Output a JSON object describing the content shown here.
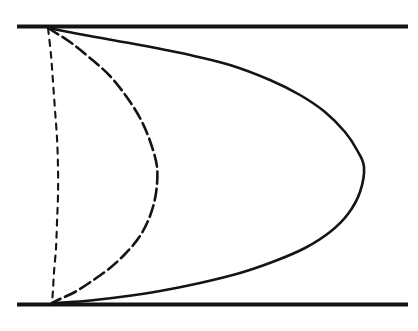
{
  "figure": {
    "background_color": "#ffffff",
    "width": 418,
    "height": 331
  },
  "chart_data": {
    "type": "line",
    "xlabel": "",
    "ylabel": "",
    "xlim": [
      0,
      418
    ],
    "ylim": [
      331,
      0
    ],
    "grid": false,
    "legend": false,
    "annotations": [],
    "walls": {
      "color": "#141414",
      "stroke_width": 4.2,
      "x_start": 17,
      "x_end": 408,
      "top_y": 26.5,
      "bottom_y": 304.5
    },
    "series": [
      {
        "name": "fully-developed-profile",
        "style": "solid",
        "color": "#141414",
        "stroke_width": 2.6,
        "dash_pattern": "none",
        "apex_x": 364,
        "apex_y": 167,
        "top_anchor_x": 48,
        "top_anchor_y": 28,
        "bottom_anchor_x": 52,
        "bottom_anchor_y": 303,
        "points": [
          [
            48,
            28
          ],
          [
            90,
            36
          ],
          [
            140,
            45
          ],
          [
            190,
            55
          ],
          [
            230,
            65
          ],
          [
            270,
            80
          ],
          [
            300,
            95
          ],
          [
            325,
            112
          ],
          [
            345,
            132
          ],
          [
            357,
            150
          ],
          [
            364,
            167
          ],
          [
            360,
            192
          ],
          [
            348,
            214
          ],
          [
            330,
            232
          ],
          [
            305,
            248
          ],
          [
            275,
            261
          ],
          [
            240,
            273
          ],
          [
            200,
            283
          ],
          [
            160,
            291
          ],
          [
            120,
            297
          ],
          [
            85,
            301
          ],
          [
            52,
            303
          ]
        ]
      },
      {
        "name": "intermediate-profile",
        "style": "dashed-long",
        "color": "#141414",
        "stroke_width": 2.6,
        "dash_pattern": "12 5",
        "apex_x": 157,
        "apex_y": 167,
        "top_anchor_x": 48,
        "top_anchor_y": 28,
        "bottom_anchor_x": 52,
        "bottom_anchor_y": 303,
        "points": [
          [
            48,
            28
          ],
          [
            70,
            42
          ],
          [
            90,
            58
          ],
          [
            110,
            76
          ],
          [
            126,
            96
          ],
          [
            140,
            118
          ],
          [
            150,
            141
          ],
          [
            157,
            167
          ],
          [
            156,
            193
          ],
          [
            150,
            216
          ],
          [
            140,
            236
          ],
          [
            126,
            253
          ],
          [
            110,
            268
          ],
          [
            92,
            281
          ],
          [
            75,
            292
          ],
          [
            60,
            299
          ],
          [
            52,
            303
          ]
        ]
      },
      {
        "name": "entrance-profile",
        "style": "dashed-short",
        "color": "#141414",
        "stroke_width": 2.1,
        "dash_pattern": "6 6",
        "apex_x": 58,
        "apex_y": 167,
        "top_anchor_x": 48,
        "top_anchor_y": 28,
        "bottom_anchor_x": 52,
        "bottom_anchor_y": 303,
        "points": [
          [
            48,
            28
          ],
          [
            51,
            55
          ],
          [
            53,
            82
          ],
          [
            55,
            110
          ],
          [
            57,
            138
          ],
          [
            58,
            167
          ],
          [
            58,
            195
          ],
          [
            57,
            222
          ],
          [
            56,
            248
          ],
          [
            54,
            272
          ],
          [
            53,
            290
          ],
          [
            52,
            303
          ]
        ]
      }
    ]
  }
}
